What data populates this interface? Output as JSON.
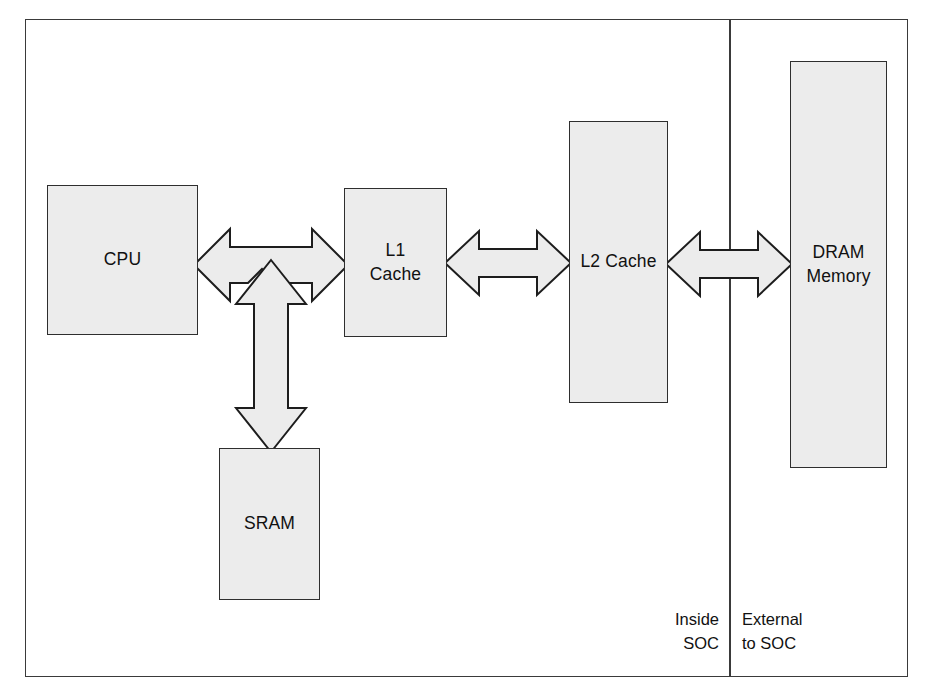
{
  "diagram": {
    "blocks": [
      {
        "id": "cpu",
        "label": "CPU",
        "region": "inside-soc"
      },
      {
        "id": "l1",
        "label": "L1\nCache",
        "region": "inside-soc"
      },
      {
        "id": "l2",
        "label": "L2 Cache",
        "region": "inside-soc"
      },
      {
        "id": "sram",
        "label": "SRAM",
        "region": "inside-soc"
      },
      {
        "id": "dram",
        "label": "DRAM\nMemory",
        "region": "external-to-soc"
      }
    ],
    "connections": [
      {
        "id": "cpu-l1",
        "from": "CPU",
        "to": "L1 Cache",
        "kind": "bidirectional",
        "orientation": "horizontal"
      },
      {
        "id": "l1-l2",
        "from": "L1 Cache",
        "to": "L2 Cache",
        "kind": "bidirectional",
        "orientation": "horizontal"
      },
      {
        "id": "l2-dram",
        "from": "L2 Cache",
        "to": "DRAM Memory",
        "kind": "bidirectional",
        "orientation": "horizontal"
      },
      {
        "id": "cpu-sram",
        "from": "CPU",
        "to": "SRAM",
        "kind": "bidirectional",
        "orientation": "vertical"
      }
    ],
    "regions": {
      "inside": "Inside\nSOC",
      "external": "External\nto SOC"
    },
    "colors": {
      "block_fill": "#ececec",
      "block_stroke": "#2e2e2e",
      "arrow_fill": "#ececec",
      "arrow_stroke": "#1d1d1d",
      "frame_stroke": "#3a3a3a",
      "text": "#111111",
      "background": "#ffffff"
    }
  }
}
